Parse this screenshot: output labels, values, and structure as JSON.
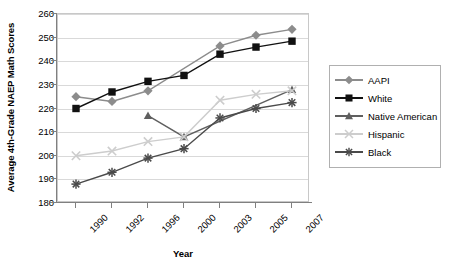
{
  "chart_data": {
    "type": "line",
    "title": "",
    "xlabel": "Year",
    "ylabel": "Average 4th-Grade NAEP Math Scores",
    "categories": [
      "1990",
      "1992",
      "1996",
      "2000",
      "2003",
      "2005",
      "2007"
    ],
    "ylim": [
      180,
      260
    ],
    "yticks": [
      180,
      190,
      200,
      210,
      220,
      230,
      240,
      250,
      260
    ],
    "grid": true,
    "legend_position": "right",
    "series": [
      {
        "name": "AAPI",
        "marker": "diamond",
        "color": "#8c8c8c",
        "values": [
          225,
          223,
          227.5,
          null,
          246.5,
          251,
          253.5
        ]
      },
      {
        "name": "White",
        "marker": "square",
        "color": "#111111",
        "values": [
          220,
          227,
          231.5,
          234,
          243,
          246,
          248.5
        ]
      },
      {
        "name": "Native American",
        "marker": "triangle",
        "color": "#5f5f5f",
        "values": [
          null,
          null,
          217,
          208,
          null,
          null,
          228
        ]
      },
      {
        "name": "Hispanic",
        "marker": "x",
        "color": "#cdcdcd",
        "values": [
          200,
          202,
          206,
          208,
          223.5,
          226,
          227.5
        ]
      },
      {
        "name": "Black",
        "marker": "asterisk",
        "color": "#4a4a4a",
        "values": [
          188,
          193,
          199,
          203,
          216,
          220,
          222.5
        ]
      }
    ]
  }
}
